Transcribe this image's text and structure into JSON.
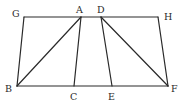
{
  "diagram": {
    "points": {
      "A": "A",
      "B": "B",
      "C": "C",
      "D": "D",
      "E": "E",
      "F": "F",
      "G": "G",
      "H": "H"
    },
    "segments": [
      [
        "G",
        "H"
      ],
      [
        "B",
        "F"
      ],
      [
        "G",
        "B"
      ],
      [
        "A",
        "B"
      ],
      [
        "A",
        "C"
      ],
      [
        "D",
        "E"
      ],
      [
        "D",
        "F"
      ],
      [
        "H",
        "F"
      ]
    ]
  }
}
